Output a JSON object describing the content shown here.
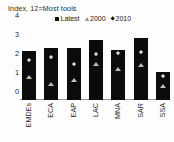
{
  "chart_data": {
    "type": "bar",
    "title": "Index, 12=Most tools",
    "xlabel": "",
    "ylabel": "",
    "ylim": [
      0,
      4
    ],
    "yticks": [
      "0",
      "1",
      "2",
      "3",
      "4"
    ],
    "grid": false,
    "legend_position": "top",
    "categories": [
      "EMDEs",
      "ECA",
      "EAP",
      "LAC",
      "MNA",
      "SAR",
      "SSA"
    ],
    "series": [
      {
        "name": "Latest",
        "marker": "square",
        "type": "bar",
        "color": "#0b0b0b",
        "values": [
          2.6,
          2.75,
          2.75,
          3.15,
          2.65,
          3.25,
          1.5
        ]
      },
      {
        "name": "2000",
        "marker": "triangle",
        "type": "scatter",
        "color": "#bdbdbd",
        "values": [
          1.2,
          0.85,
          1.05,
          1.9,
          1.65,
          1.85,
          0.75
        ]
      },
      {
        "name": "2010",
        "marker": "diamond",
        "type": "scatter",
        "color": "#d8d8d8",
        "values": [
          2.1,
          2.25,
          1.9,
          2.4,
          2.45,
          2.5,
          1.25
        ]
      }
    ]
  },
  "legend": {
    "items": [
      {
        "label": "Latest"
      },
      {
        "label": "2000"
      },
      {
        "label": "2010"
      }
    ]
  }
}
